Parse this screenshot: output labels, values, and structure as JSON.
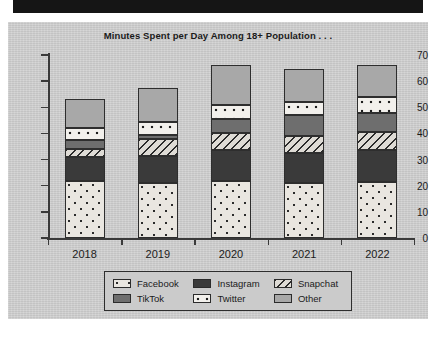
{
  "chart_data": {
    "type": "bar",
    "subtype": "stacked-bar",
    "title": "Minutes Spent per Day Among 18+ Population . . .",
    "xlabel": "",
    "ylabel": "",
    "categories": [
      "2018",
      "2019",
      "2020",
      "2021",
      "2022"
    ],
    "ylim": [
      0,
      70
    ],
    "y_ticks": [
      0,
      10,
      20,
      30,
      40,
      50,
      60,
      70
    ],
    "y_tick_labels": [
      "0",
      "10",
      "20",
      "30",
      "40",
      "50",
      "60",
      "70"
    ],
    "grid": false,
    "legend_position": "bottom",
    "series": [
      {
        "name": "Facebook",
        "values": [
          22.0,
          21.0,
          22.0,
          21.0,
          21.5
        ]
      },
      {
        "name": "Instagram",
        "values": [
          9.0,
          10.5,
          11.5,
          11.5,
          12.0
        ]
      },
      {
        "name": "Snapchat",
        "values": [
          3.0,
          6.5,
          6.5,
          6.5,
          7.0
        ]
      },
      {
        "name": "TikTok",
        "values": [
          3.5,
          1.5,
          5.5,
          8.0,
          7.5
        ]
      },
      {
        "name": "Twitter",
        "values": [
          4.5,
          5.0,
          5.5,
          5.0,
          6.0
        ]
      },
      {
        "name": "Other",
        "values": [
          11.0,
          13.0,
          15.0,
          12.5,
          12.0
        ]
      }
    ],
    "totals": [
      53.0,
      57.5,
      66.0,
      64.5,
      66.0
    ]
  },
  "legend": {
    "entries": [
      {
        "label": "Facebook",
        "pattern": "dotted-light"
      },
      {
        "label": "Instagram",
        "pattern": "solid-dark"
      },
      {
        "label": "Snapchat",
        "pattern": "diagonal-hatch"
      },
      {
        "label": "TikTok",
        "pattern": "solid-mid-gray"
      },
      {
        "label": "Twitter",
        "pattern": "large-dots"
      },
      {
        "label": "Other",
        "pattern": "solid-light-gray"
      }
    ]
  },
  "colors": {
    "panel_background": "#cfcfcf",
    "axis": "#3a3a3a",
    "text": "#1b1b1b",
    "facebook": "#e9e6e0",
    "instagram": "#3a3a3a",
    "snapchat": "#dedbd5",
    "tiktok": "#6e6e6e",
    "twitter": "#f2f0ec",
    "other": "#a8a8a8",
    "top_band": "#151515"
  }
}
